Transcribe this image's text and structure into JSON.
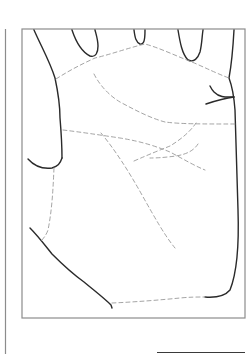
{
  "figure": {
    "colors": {
      "outline": "#2a2a2a",
      "crease": "#9a9a9a",
      "frame": "#8c8c8c",
      "background": "#ffffff"
    }
  }
}
